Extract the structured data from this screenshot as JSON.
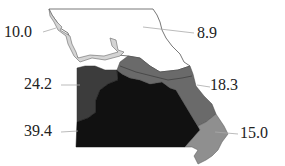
{
  "map": {
    "title": "",
    "regions": [
      {
        "id": "north",
        "value": "8.9",
        "fill": "#ffffff"
      },
      {
        "id": "northwest-river",
        "value": "10.0",
        "fill": "#d4d4d4"
      },
      {
        "id": "west",
        "value": "24.2",
        "fill": "#3c3c3c"
      },
      {
        "id": "southwest-central",
        "value": "39.4",
        "fill": "#111111"
      },
      {
        "id": "east-central",
        "value": "18.3",
        "fill": "#6a6a6a"
      },
      {
        "id": "southeast",
        "value": "15.0",
        "fill": "#8f8f8f"
      }
    ],
    "labels": {
      "northwest_river": "10.0",
      "north": "8.9",
      "west": "24.2",
      "east_central": "18.3",
      "southwest_central": "39.4",
      "southeast": "15.0"
    }
  }
}
